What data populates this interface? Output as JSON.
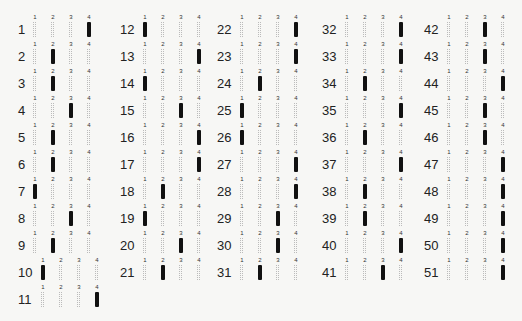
{
  "sheet": {
    "options": [
      "1",
      "2",
      "3",
      "4"
    ],
    "columns": [
      {
        "questions": [
          {
            "n": "1",
            "a": 4
          },
          {
            "n": "2",
            "a": 2
          },
          {
            "n": "3",
            "a": 2
          },
          {
            "n": "4",
            "a": 3
          },
          {
            "n": "5",
            "a": 2
          },
          {
            "n": "6",
            "a": 2
          },
          {
            "n": "7",
            "a": 1
          },
          {
            "n": "8",
            "a": 3
          },
          {
            "n": "9",
            "a": 2
          },
          {
            "n": "10",
            "a": 1
          },
          {
            "n": "11",
            "a": 4
          }
        ]
      },
      {
        "questions": [
          {
            "n": "12",
            "a": 1
          },
          {
            "n": "13",
            "a": 4
          },
          {
            "n": "14",
            "a": 1
          },
          {
            "n": "15",
            "a": 3
          },
          {
            "n": "16",
            "a": 4
          },
          {
            "n": "17",
            "a": 4
          },
          {
            "n": "18",
            "a": 2
          },
          {
            "n": "19",
            "a": 1
          },
          {
            "n": "20",
            "a": 3
          },
          {
            "n": "21",
            "a": 2
          }
        ]
      },
      {
        "questions": [
          {
            "n": "22",
            "a": 4
          },
          {
            "n": "23",
            "a": 4
          },
          {
            "n": "24",
            "a": 2
          },
          {
            "n": "25",
            "a": 1
          },
          {
            "n": "26",
            "a": 1
          },
          {
            "n": "27",
            "a": 4
          },
          {
            "n": "28",
            "a": 4
          },
          {
            "n": "29",
            "a": 3
          },
          {
            "n": "30",
            "a": 3
          },
          {
            "n": "31",
            "a": 2
          }
        ]
      },
      {
        "questions": [
          {
            "n": "32",
            "a": 4
          },
          {
            "n": "33",
            "a": 4
          },
          {
            "n": "34",
            "a": 2
          },
          {
            "n": "35",
            "a": 4
          },
          {
            "n": "36",
            "a": 2
          },
          {
            "n": "37",
            "a": 4
          },
          {
            "n": "38",
            "a": 2
          },
          {
            "n": "39",
            "a": 2
          },
          {
            "n": "40",
            "a": 4
          },
          {
            "n": "41",
            "a": 3
          }
        ]
      },
      {
        "questions": [
          {
            "n": "42",
            "a": 3
          },
          {
            "n": "43",
            "a": 3
          },
          {
            "n": "44",
            "a": 4
          },
          {
            "n": "45",
            "a": 3
          },
          {
            "n": "46",
            "a": 3
          },
          {
            "n": "47",
            "a": 4
          },
          {
            "n": "48",
            "a": 4
          },
          {
            "n": "49",
            "a": 4
          },
          {
            "n": "50",
            "a": 4
          },
          {
            "n": "51",
            "a": 4
          }
        ]
      }
    ]
  }
}
